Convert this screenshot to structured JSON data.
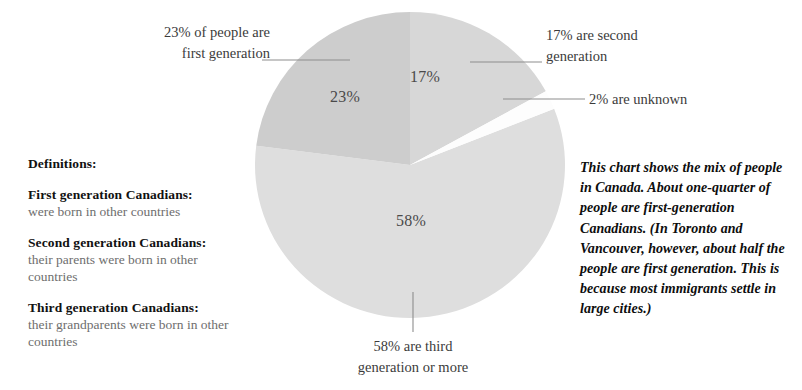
{
  "chart_data": {
    "type": "pie",
    "title": "",
    "categories": [
      "17% are second generation",
      "2% are unknown",
      "58% are third generation or more",
      "23% of people are first generation"
    ],
    "values": [
      17,
      2,
      58,
      23
    ],
    "labels": [
      "17%",
      "2%",
      "58%",
      "23%"
    ],
    "colors": [
      "#d7d7d7",
      "#fdfdfd",
      "#dedede",
      "#cdcdcd"
    ],
    "start_angle_deg": 0,
    "direction": "clockwise",
    "legend": "none",
    "grid": false,
    "units": "percent"
  },
  "slice_labels": {
    "first": "23%",
    "second": "17%",
    "third": "58%"
  },
  "callouts": {
    "first_generation": "23% of people are\nfirst generation",
    "second_generation": "17% are second\ngeneration",
    "unknown": "2% are unknown",
    "third_generation": "58% are third\ngeneration or more"
  },
  "definitions": {
    "title": "Definitions:",
    "items": [
      {
        "term": "First generation Canadians:",
        "description": "were born in other countries"
      },
      {
        "term": "Second generation Canadians:",
        "description": "their parents were born in other countries"
      },
      {
        "term": "Third generation Canadians:",
        "description": "their grandparents were born in other countries"
      }
    ]
  },
  "commentary": {
    "text": "This chart shows the mix of people in Canada. About one-quarter of people are first-generation Canadians. (In Toronto and Vancouver, however, about half the people are first generation. This is because most immigrants settle in large cities.)"
  },
  "colors": {
    "slice_first_generation": "#cdcdcd",
    "slice_second_generation": "#d7d7d7",
    "slice_third_generation": "#dedede",
    "slice_unknown": "#fdfdfd",
    "leader_line": "#8d8d8d",
    "background": "#ffffff",
    "text_primary": "#111111",
    "text_muted": "#6e6e6e"
  }
}
